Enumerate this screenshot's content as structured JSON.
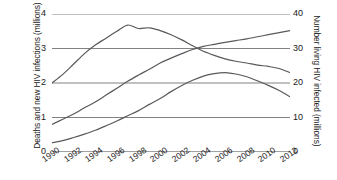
{
  "chart_data": {
    "type": "line",
    "title": "",
    "xlabel": "",
    "ylabel": "Deaths and new HIV infections (millions)",
    "ylabel_right": "Number living HIV infected (millions)",
    "x": [
      1990,
      1991,
      1992,
      1993,
      1994,
      1995,
      1996,
      1997,
      1998,
      1999,
      2000,
      2001,
      2002,
      2003,
      2004,
      2005,
      2006,
      2007,
      2008,
      2009,
      2010,
      2011,
      2012
    ],
    "xlim": [
      1990,
      2012
    ],
    "ylim": [
      0,
      4
    ],
    "ylim_right": [
      0,
      40
    ],
    "grid": true,
    "legend_position": "none",
    "xtick_labels": [
      "1990",
      "1992",
      "1994",
      "1996",
      "1998",
      "2000",
      "2002",
      "2004",
      "2006",
      "2008",
      "2010",
      "2012"
    ],
    "xtick_values": [
      1990,
      1992,
      1994,
      1996,
      1998,
      2000,
      2002,
      2004,
      2006,
      2008,
      2010,
      2012
    ],
    "ytick_labels_left": [
      "0",
      "1",
      "2",
      "3",
      "4"
    ],
    "ytick_values_left": [
      0,
      1,
      2,
      3,
      4
    ],
    "ytick_labels_right": [
      "0",
      "10",
      "20",
      "30",
      "40"
    ],
    "ytick_values_right": [
      0,
      10,
      20,
      30,
      40
    ],
    "line_color": "#58595b",
    "grid_color": "#808285",
    "series": [
      {
        "name": "New HIV infections",
        "axis": "left",
        "units": "millions",
        "values": [
          2.0,
          2.25,
          2.55,
          2.85,
          3.1,
          3.3,
          3.5,
          3.68,
          3.58,
          3.6,
          3.52,
          3.4,
          3.25,
          3.08,
          2.92,
          2.8,
          2.7,
          2.63,
          2.58,
          2.52,
          2.48,
          2.42,
          2.3
        ]
      },
      {
        "name": "Number living with HIV",
        "axis": "right",
        "units": "millions",
        "values": [
          8.0,
          9.5,
          11.0,
          12.8,
          14.5,
          16.5,
          18.5,
          20.5,
          22.3,
          24.0,
          25.8,
          27.2,
          28.5,
          29.7,
          30.6,
          31.2,
          31.8,
          32.3,
          32.8,
          33.4,
          34.0,
          34.6,
          35.2
        ]
      },
      {
        "name": "Deaths",
        "axis": "left",
        "units": "millions",
        "values": [
          0.27,
          0.33,
          0.42,
          0.52,
          0.63,
          0.76,
          0.9,
          1.05,
          1.2,
          1.38,
          1.55,
          1.75,
          1.93,
          2.08,
          2.2,
          2.27,
          2.3,
          2.26,
          2.18,
          2.06,
          1.93,
          1.78,
          1.6
        ]
      }
    ]
  },
  "axes": {
    "left_title": "Deaths and new HIV infections (millions)",
    "right_title": "Number living HIV infected (millions)"
  }
}
